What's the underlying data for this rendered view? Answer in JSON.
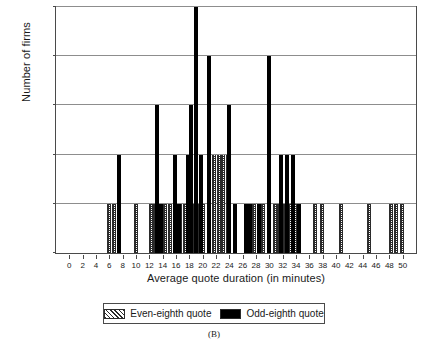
{
  "caption": "(B)",
  "legend": {
    "position": "below-axis",
    "entries": [
      {
        "key": "even",
        "label": "Even-eighth quote",
        "pattern": "hatched",
        "color": "#2b2b2b"
      },
      {
        "key": "odd",
        "label": "Odd-eighth quote",
        "pattern": "solid",
        "color": "#000000"
      }
    ]
  },
  "chart_data": {
    "type": "bar",
    "title": "",
    "subtitle": "",
    "xlabel": "Average quote duration (in minutes)",
    "ylabel": "Number of firms",
    "xlim": [
      -2,
      52
    ],
    "ylim": [
      0,
      5
    ],
    "xticks": [
      0,
      2,
      4,
      6,
      8,
      10,
      12,
      14,
      16,
      18,
      20,
      22,
      24,
      26,
      28,
      30,
      32,
      34,
      36,
      38,
      40,
      42,
      44,
      46,
      48,
      50
    ],
    "yticks": [
      0,
      1,
      2,
      3,
      4,
      5
    ],
    "grid": "horizontal",
    "grid_values": [
      1,
      2,
      3,
      4,
      5
    ],
    "bar_width_minutes": 0.62,
    "series": [
      {
        "name": "Even-eighth quote",
        "key": "even",
        "pattern": "hatched",
        "color": "#2b2b2b",
        "points": [
          {
            "x": 6.0,
            "y": 1
          },
          {
            "x": 6.7,
            "y": 1
          },
          {
            "x": 10.0,
            "y": 1
          },
          {
            "x": 12.2,
            "y": 1
          },
          {
            "x": 12.9,
            "y": 1
          },
          {
            "x": 14.4,
            "y": 1
          },
          {
            "x": 15.1,
            "y": 1
          },
          {
            "x": 16.6,
            "y": 1
          },
          {
            "x": 17.3,
            "y": 1
          },
          {
            "x": 18.0,
            "y": 1
          },
          {
            "x": 18.7,
            "y": 1
          },
          {
            "x": 19.4,
            "y": 1
          },
          {
            "x": 20.1,
            "y": 1
          },
          {
            "x": 21.0,
            "y": 2
          },
          {
            "x": 21.7,
            "y": 2
          },
          {
            "x": 22.4,
            "y": 2
          },
          {
            "x": 23.1,
            "y": 2
          },
          {
            "x": 23.8,
            "y": 2
          },
          {
            "x": 27.7,
            "y": 1
          },
          {
            "x": 29.0,
            "y": 1
          },
          {
            "x": 30.0,
            "y": 2
          },
          {
            "x": 30.8,
            "y": 1
          },
          {
            "x": 31.5,
            "y": 1
          },
          {
            "x": 32.3,
            "y": 1
          },
          {
            "x": 33.1,
            "y": 1
          },
          {
            "x": 33.9,
            "y": 1
          },
          {
            "x": 36.8,
            "y": 1
          },
          {
            "x": 37.9,
            "y": 1
          },
          {
            "x": 40.8,
            "y": 1
          },
          {
            "x": 45.0,
            "y": 1
          },
          {
            "x": 48.2,
            "y": 1
          },
          {
            "x": 49.0,
            "y": 1
          },
          {
            "x": 49.9,
            "y": 1
          }
        ]
      },
      {
        "name": "Odd-eighth quote",
        "key": "odd",
        "pattern": "solid",
        "color": "#000000",
        "points": [
          {
            "x": 7.4,
            "y": 2
          },
          {
            "x": 13.1,
            "y": 3
          },
          {
            "x": 13.7,
            "y": 1
          },
          {
            "x": 15.8,
            "y": 2
          },
          {
            "x": 16.4,
            "y": 1
          },
          {
            "x": 17.8,
            "y": 2
          },
          {
            "x": 18.3,
            "y": 3
          },
          {
            "x": 19.0,
            "y": 5
          },
          {
            "x": 19.8,
            "y": 2
          },
          {
            "x": 21.0,
            "y": 4
          },
          {
            "x": 24.0,
            "y": 3
          },
          {
            "x": 24.8,
            "y": 1
          },
          {
            "x": 26.5,
            "y": 1
          },
          {
            "x": 27.1,
            "y": 1
          },
          {
            "x": 28.4,
            "y": 1
          },
          {
            "x": 30.0,
            "y": 4
          },
          {
            "x": 31.8,
            "y": 2
          },
          {
            "x": 32.7,
            "y": 2
          },
          {
            "x": 33.5,
            "y": 2
          },
          {
            "x": 34.5,
            "y": 1
          }
        ]
      }
    ]
  }
}
